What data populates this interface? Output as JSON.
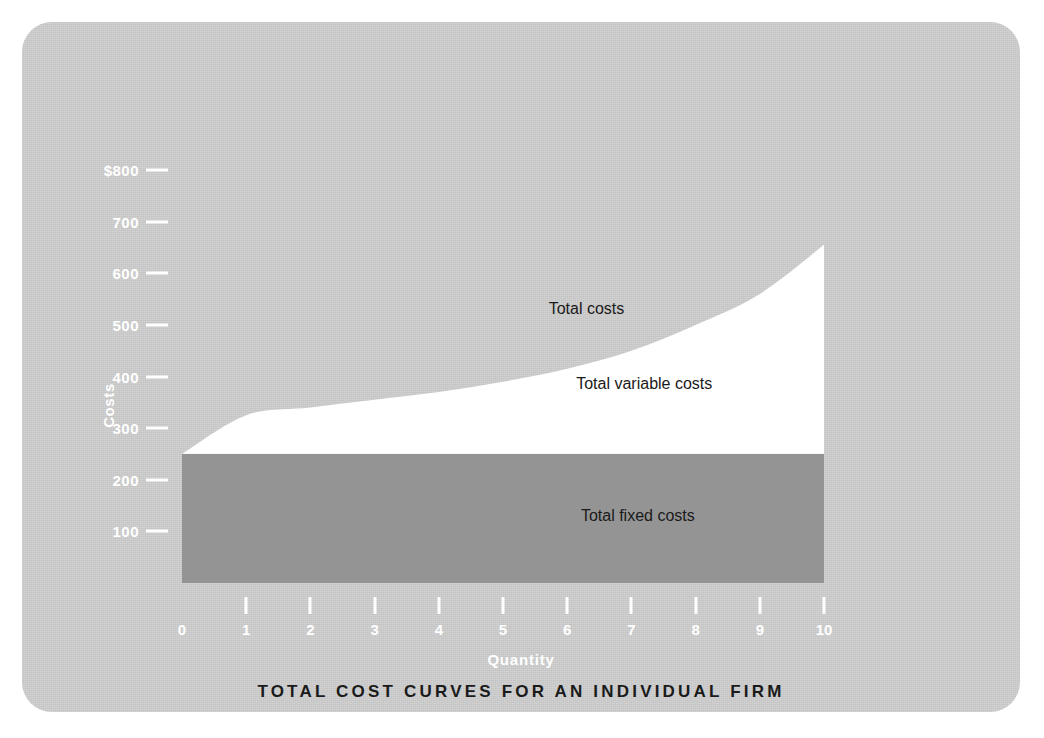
{
  "figure": {
    "background_color": "#ffffff",
    "card_color": "#c9c9c9",
    "fixed_cost_fill": "#949494",
    "variable_cost_fill": "#ffffff",
    "axis_text_color": "#ffffff",
    "title_color": "#1a1a1a"
  },
  "chart_data": {
    "type": "area",
    "title": "TOTAL COST CURVES FOR AN INDIVIDUAL FIRM",
    "xlabel": "Quantity",
    "ylabel": "Costs",
    "xlim": [
      0,
      10
    ],
    "ylim": [
      0,
      800
    ],
    "grid": false,
    "legend": "inline-annotations",
    "x": [
      0,
      1,
      2,
      3,
      4,
      5,
      6,
      7,
      8,
      9,
      10
    ],
    "xtick_labels": [
      "0",
      "1",
      "2",
      "3",
      "4",
      "5",
      "6",
      "7",
      "8",
      "9",
      "10"
    ],
    "ytick_labels": [
      "$800",
      "700",
      "600",
      "500",
      "400",
      "300",
      "200",
      "100"
    ],
    "ytick_values": [
      800,
      700,
      600,
      500,
      400,
      300,
      200,
      100
    ],
    "series": [
      {
        "name": "Total fixed costs",
        "fill": "#949494",
        "values": [
          250,
          250,
          250,
          250,
          250,
          250,
          250,
          250,
          250,
          250,
          250
        ]
      },
      {
        "name": "Total variable costs",
        "fill": "#ffffff",
        "values": [
          0,
          75,
          90,
          105,
          120,
          140,
          165,
          200,
          250,
          310,
          405
        ]
      },
      {
        "name": "Total costs",
        "fill": "#ffffff",
        "values": [
          250,
          325,
          340,
          355,
          370,
          390,
          415,
          450,
          500,
          560,
          655
        ]
      }
    ],
    "annotations": [
      {
        "text": "Total costs",
        "x": 6.3,
        "y": 530
      },
      {
        "text": "Total variable costs",
        "x": 7.2,
        "y": 385
      },
      {
        "text": "Total fixed costs",
        "x": 7.1,
        "y": 130
      }
    ]
  }
}
